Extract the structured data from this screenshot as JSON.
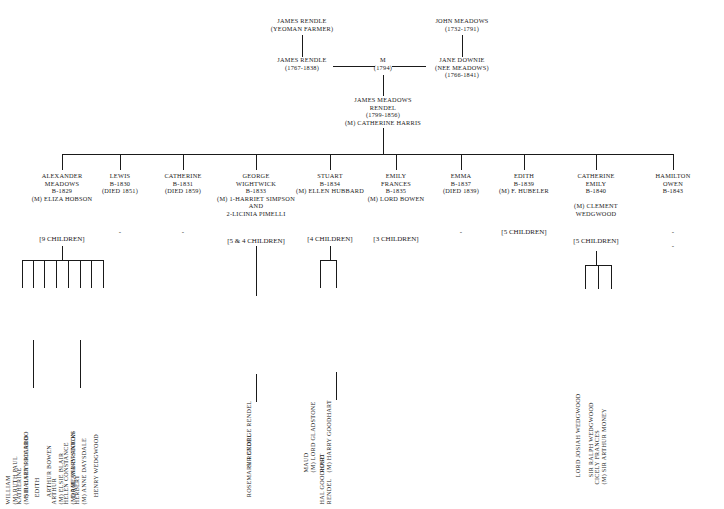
{
  "generation1": [
    {
      "id": "james-rendle-yeoman",
      "lines": [
        "JAMES RENDLE",
        "(YEOMAN FARMER)"
      ]
    },
    {
      "id": "john-meadows",
      "lines": [
        "JOHN MEADOWS",
        "(1732-1791)"
      ]
    }
  ],
  "generation2": [
    {
      "id": "james-rendle",
      "lines": [
        "JAMES RENDLE",
        "(1767-1838)"
      ]
    },
    {
      "id": "marriage-1794",
      "lines": [
        "M",
        "(1794)"
      ]
    },
    {
      "id": "jane-downie",
      "lines": [
        "JANE DOWNIE",
        "(NEE MEADOWS)",
        "(1766-1841)"
      ]
    }
  ],
  "generation3": [
    {
      "id": "james-meadows-rendel",
      "lines": [
        "JAMES MEADOWS",
        "RENDEL",
        "(1799-1856)",
        "(M) CATHERINE HARRIS"
      ]
    }
  ],
  "children": [
    {
      "id": "alexander-meadows",
      "lines": [
        "ALEXANDER",
        "MEADOWS",
        "B-1829",
        "(M) ELIZA HOBSON"
      ],
      "issue": "[9 CHILDREN]"
    },
    {
      "id": "lewis",
      "lines": [
        "LEWIS",
        "B-1830",
        "(DIED 1851)"
      ],
      "issue": "-"
    },
    {
      "id": "catherine",
      "lines": [
        "CATHERINE",
        "B-1831",
        "(DIED 1859)"
      ],
      "issue": "-"
    },
    {
      "id": "george-wightwick",
      "lines": [
        "GEORGE",
        "WIGHTWICK",
        "B-1833",
        "(M) 1-HARRIET SIMPSON",
        "AND",
        "2-LICINIA PIMELLI"
      ],
      "issue": "[5 & 4 CHILDREN]"
    },
    {
      "id": "stuart",
      "lines": [
        "STUART",
        "B-1834",
        "(M) ELLEN HUBBARD"
      ],
      "issue": "[4 CHILDREN]"
    },
    {
      "id": "emily-frances",
      "lines": [
        "EMILY",
        "FRANCES",
        "B-1835",
        "(M) LORD BOWEN"
      ],
      "issue": "[3 CHILDREN]"
    },
    {
      "id": "emma",
      "lines": [
        "EMMA",
        "B-1837",
        "(DIED 1839)"
      ],
      "issue": "-"
    },
    {
      "id": "edith",
      "lines": [
        "EDITH",
        "B-1839",
        "(M) F. HUBELER"
      ],
      "issue": "[5 CHILDREN]"
    },
    {
      "id": "catherine-emily",
      "lines": [
        "CATHERINE",
        "EMILY",
        "B-1840",
        "",
        "(M) CLEMENT",
        "WEDGWOOD"
      ],
      "issue": "[5 CHILDREN]"
    },
    {
      "id": "hamilton-owen",
      "lines": [
        "HAMILTON",
        "OWEN",
        "B-1843"
      ],
      "issue": "-",
      "issue2": "-"
    }
  ],
  "alexander_descendants": [
    {
      "id": "william",
      "lines": [
        "WILLIAM",
        "(M) RUTH PAUL"
      ]
    },
    {
      "id": "katherine",
      "lines": [
        "KATHERINE",
        "(M) HALSEY RICARDO"
      ]
    },
    {
      "id": "edith-desc",
      "lines": [
        "EDITH"
      ]
    },
    {
      "id": "arthur-bowen",
      "lines": [
        "ARTHUR BOWEN"
      ]
    },
    {
      "id": "arthur-elsie",
      "lines": [
        "ARTHUR",
        "(M) ELSIE BLAIR"
      ]
    },
    {
      "id": "helen-constance",
      "lines": [
        "HELEN CONSTANCE",
        "(M) ROLAND BRANTON"
      ]
    },
    {
      "id": "herbert",
      "lines": [
        "HERBERT",
        "(M) ANNE DAYSDALE"
      ]
    },
    {
      "id": "henry-wedgwood",
      "lines": [
        "HENRY WEDGWOOD"
      ]
    }
  ],
  "alexander_grandchildren": [
    {
      "id": "sir-harry-ricardo",
      "lines": [
        "SIR HARRY RICARDO"
      ]
    },
    {
      "id": "dame-mary-stocks",
      "lines": [
        "DAME MARY STOCKS"
      ]
    }
  ],
  "george_descendants": [
    {
      "id": "sir-george-rendel",
      "lines": [
        "SIR GEORGE RENDEL"
      ]
    }
  ],
  "george_grandchildren": [
    {
      "id": "rosemary-rendel",
      "lines": [
        "ROSEMARY RENDEL"
      ]
    }
  ],
  "stuart_descendants": [
    {
      "id": "maud",
      "lines": [
        "MAUD",
        "(M) LORD GLADSTONE"
      ]
    },
    {
      "id": "rose",
      "lines": [
        "ROSE",
        "(M) HARRY GOODHART"
      ]
    }
  ],
  "stuart_grandchildren": [
    {
      "id": "hal-goodhart-rendel",
      "lines": [
        "HAL GOODHART",
        "RENDEL"
      ]
    }
  ],
  "wedgwood_descendants": [
    {
      "id": "lord-josiah-wedgwood",
      "lines": [
        "LORD JOSIAH WEDGWOOD"
      ]
    },
    {
      "id": "sir-ralph-wedgwood",
      "lines": [
        "SIR RALPH WEDGWOOD"
      ]
    },
    {
      "id": "cicely-frances",
      "lines": [
        "CICELY FRANCES",
        "(M) SIR ARTHUR MONEY"
      ]
    }
  ],
  "colors": {
    "ink": "#1a1a1a",
    "background": "#ffffff"
  }
}
